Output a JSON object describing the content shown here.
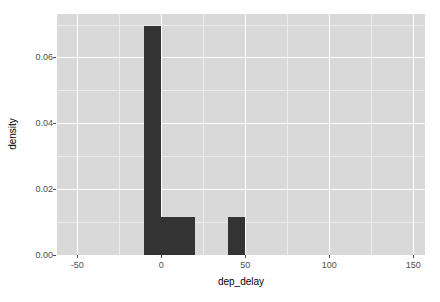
{
  "chart_data": {
    "type": "bar",
    "title": "",
    "xlabel": "dep_delay",
    "ylabel": "density",
    "xlim": [
      -62,
      157
    ],
    "ylim": [
      0,
      0.0732
    ],
    "grid": true,
    "legend": "none",
    "bin_width": 10,
    "bar_color": "#333333",
    "panel_background": "#d9d9d9",
    "major_gridline_color": "#ffffff",
    "minor_gridline_color": "#ececec",
    "xticks": [
      {
        "value": -50,
        "label": "-50"
      },
      {
        "value": 0,
        "label": "0"
      },
      {
        "value": 50,
        "label": "50"
      },
      {
        "value": 100,
        "label": "100"
      },
      {
        "value": 150,
        "label": "150"
      }
    ],
    "yticks": [
      {
        "value": 0.0,
        "label": "0.00"
      },
      {
        "value": 0.02,
        "label": "0.02"
      },
      {
        "value": 0.04,
        "label": "0.04"
      },
      {
        "value": 0.06,
        "label": "0.06"
      }
    ],
    "x_minor_ticks": [
      -25,
      25,
      75,
      125
    ],
    "y_minor_ticks": [
      0.01,
      0.03,
      0.05,
      0.07
    ],
    "bins": [
      {
        "x0": -10,
        "x1": 0,
        "density": 0.0696
      },
      {
        "x0": 0,
        "x1": 10,
        "density": 0.0116
      },
      {
        "x0": 10,
        "x1": 20,
        "density": 0.0116
      },
      {
        "x0": 40,
        "x1": 50,
        "density": 0.0116
      }
    ]
  }
}
